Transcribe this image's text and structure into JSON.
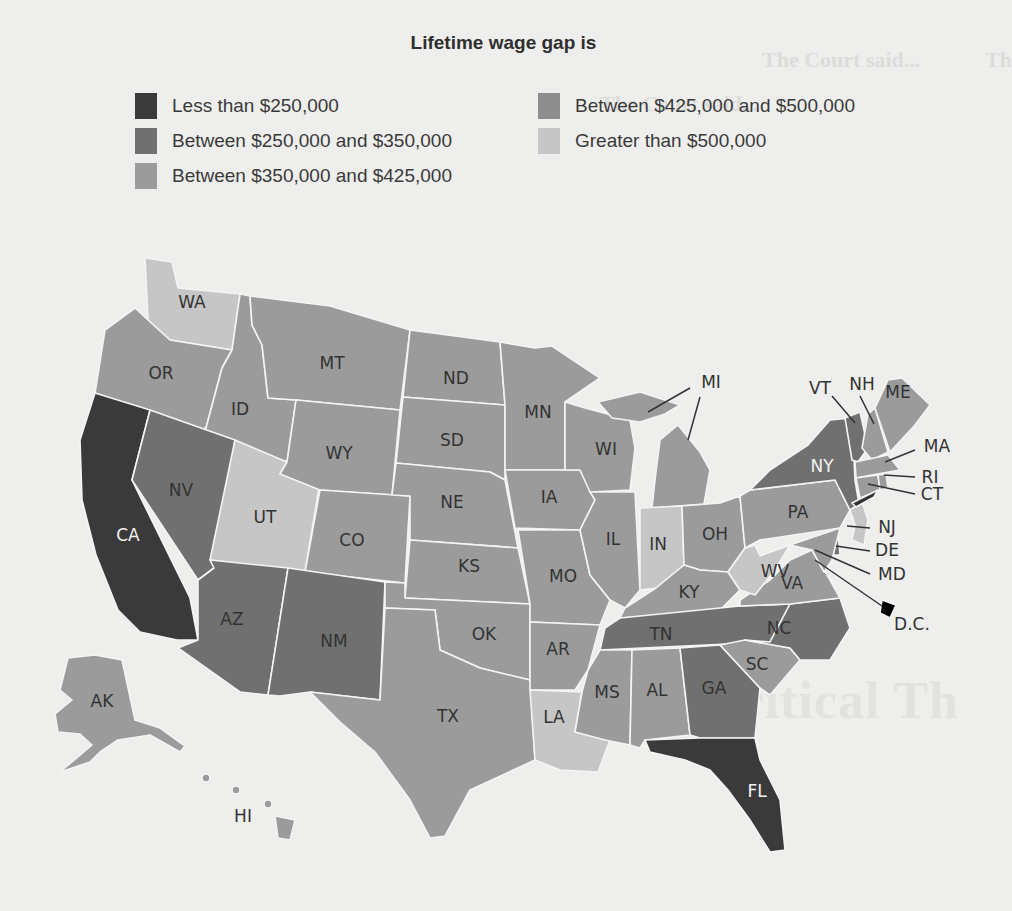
{
  "page": {
    "title": "Lifetime wage gap is",
    "background_color": "#eeeeec"
  },
  "legend": {
    "items": [
      {
        "id": "lt250",
        "label": "Less than $250,000",
        "color": "#3a3a3a"
      },
      {
        "id": "250_350",
        "label": "Between $250,000 and $350,000",
        "color": "#707070"
      },
      {
        "id": "350_425",
        "label": "Between $350,000 and $425,000",
        "color": "#9b9b9b"
      },
      {
        "id": "425_500",
        "label": "Between $425,000 and $500,000",
        "color": "#8e8e8e"
      },
      {
        "id": "gt500",
        "label": "Greater than $500,000",
        "color": "#c6c6c6"
      }
    ]
  },
  "ghost_text": {
    "heading_right": "The Court said...",
    "heading_center": "The Court said...",
    "heading_far_right": "Th",
    "big_word": "Critical Th"
  },
  "states": [
    {
      "abbr": "WA",
      "category": "gt500"
    },
    {
      "abbr": "OR",
      "category": "350_425"
    },
    {
      "abbr": "CA",
      "category": "lt250"
    },
    {
      "abbr": "ID",
      "category": "350_425"
    },
    {
      "abbr": "NV",
      "category": "250_350"
    },
    {
      "abbr": "UT",
      "category": "gt500"
    },
    {
      "abbr": "AZ",
      "category": "250_350"
    },
    {
      "abbr": "MT",
      "category": "350_425"
    },
    {
      "abbr": "WY",
      "category": "350_425"
    },
    {
      "abbr": "CO",
      "category": "350_425"
    },
    {
      "abbr": "NM",
      "category": "250_350"
    },
    {
      "abbr": "ND",
      "category": "350_425"
    },
    {
      "abbr": "SD",
      "category": "350_425"
    },
    {
      "abbr": "NE",
      "category": "350_425"
    },
    {
      "abbr": "KS",
      "category": "350_425"
    },
    {
      "abbr": "OK",
      "category": "350_425"
    },
    {
      "abbr": "TX",
      "category": "350_425"
    },
    {
      "abbr": "MN",
      "category": "350_425"
    },
    {
      "abbr": "IA",
      "category": "350_425"
    },
    {
      "abbr": "MO",
      "category": "350_425"
    },
    {
      "abbr": "AR",
      "category": "350_425"
    },
    {
      "abbr": "LA",
      "category": "gt500"
    },
    {
      "abbr": "WI",
      "category": "350_425"
    },
    {
      "abbr": "IL",
      "category": "350_425"
    },
    {
      "abbr": "MI",
      "category": "350_425"
    },
    {
      "abbr": "IN",
      "category": "gt500"
    },
    {
      "abbr": "OH",
      "category": "350_425"
    },
    {
      "abbr": "KY",
      "category": "350_425"
    },
    {
      "abbr": "TN",
      "category": "250_350"
    },
    {
      "abbr": "MS",
      "category": "350_425"
    },
    {
      "abbr": "AL",
      "category": "350_425"
    },
    {
      "abbr": "GA",
      "category": "250_350"
    },
    {
      "abbr": "FL",
      "category": "lt250"
    },
    {
      "abbr": "SC",
      "category": "350_425"
    },
    {
      "abbr": "NC",
      "category": "250_350"
    },
    {
      "abbr": "VA",
      "category": "350_425"
    },
    {
      "abbr": "WV",
      "category": "gt500"
    },
    {
      "abbr": "PA",
      "category": "350_425"
    },
    {
      "abbr": "NY",
      "category": "250_350"
    },
    {
      "abbr": "VT",
      "category": "250_350"
    },
    {
      "abbr": "NH",
      "category": "350_425"
    },
    {
      "abbr": "ME",
      "category": "350_425"
    },
    {
      "abbr": "MA",
      "category": "350_425"
    },
    {
      "abbr": "RI",
      "category": "350_425"
    },
    {
      "abbr": "CT",
      "category": "350_425"
    },
    {
      "abbr": "NJ",
      "category": "gt500"
    },
    {
      "abbr": "DE",
      "category": "250_350"
    },
    {
      "abbr": "MD",
      "category": "350_425"
    },
    {
      "abbr": "D.C.",
      "category": "350_425"
    },
    {
      "abbr": "AK",
      "category": "350_425"
    },
    {
      "abbr": "HI",
      "category": "350_425"
    }
  ]
}
